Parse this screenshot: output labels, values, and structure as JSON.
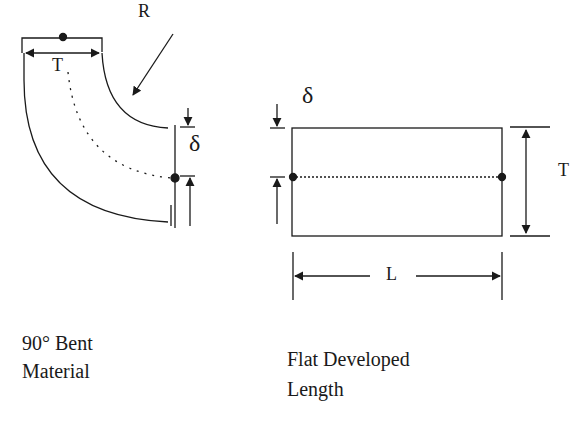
{
  "diagram": {
    "bent": {
      "label_line1": "90° Bent",
      "label_line2": "Material",
      "thickness_label": "T",
      "radius_label": "R",
      "offset_label": "δ"
    },
    "flat": {
      "label_line1": "Flat Developed",
      "label_line2": "Length",
      "thickness_label": "T",
      "length_label": "L",
      "offset_label": "δ"
    },
    "colors": {
      "line": "#1a1a1a",
      "background": "#ffffff"
    }
  }
}
